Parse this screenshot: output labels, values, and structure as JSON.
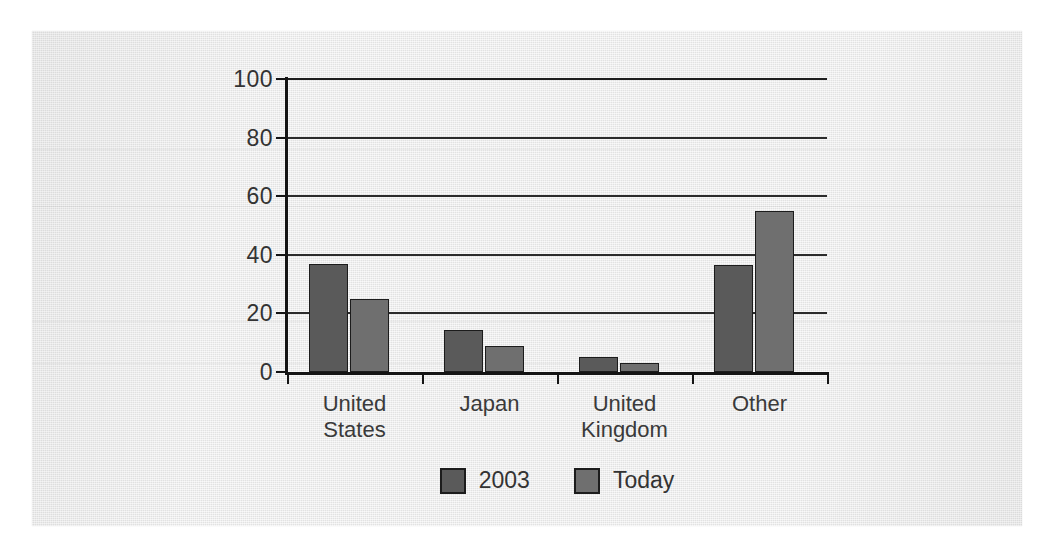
{
  "chart_data": {
    "type": "bar",
    "title": "",
    "subtitle": "",
    "xlabel": "",
    "ylabel": "",
    "categories": [
      "United States",
      "Japan",
      "United Kingdom",
      "Other"
    ],
    "category_lines": [
      [
        "United",
        "States"
      ],
      [
        "Japan"
      ],
      [
        "United",
        "Kingdom"
      ],
      [
        "Other"
      ]
    ],
    "series": [
      {
        "name": "2003",
        "values": [
          37,
          14.5,
          5,
          36.5
        ],
        "color": "#5a5a5a"
      },
      {
        "name": "Today",
        "values": [
          25,
          9,
          3,
          55
        ],
        "color": "#6f6f6f"
      }
    ],
    "ylim": [
      0,
      100
    ],
    "yticks": [
      0,
      20,
      40,
      60,
      80,
      100
    ],
    "ytick_labels": [
      "0",
      "20",
      "40",
      "60",
      "80",
      "100"
    ],
    "grid": "horizontal",
    "legend_position": "bottom-center",
    "bar_border_color": "#1c1c1c",
    "axis_color": "#141414",
    "panel_background": "#e6e6e6"
  },
  "legend": {
    "items": [
      {
        "label": "2003"
      },
      {
        "label": "Today"
      }
    ]
  }
}
